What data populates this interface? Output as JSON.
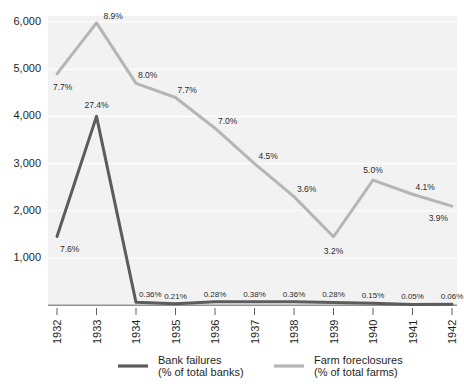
{
  "chart_data": {
    "type": "line",
    "title": "",
    "subtitle": "",
    "xlabel": "",
    "ylabel": "",
    "categories": [
      "1932",
      "1933",
      "1934",
      "1935",
      "1936",
      "1937",
      "1938",
      "1939",
      "1940",
      "1941",
      "1942"
    ],
    "ylim": [
      0,
      6300
    ],
    "yticks": [
      1000,
      2000,
      3000,
      4000,
      5000,
      6000
    ],
    "ytick_labels": [
      "1,000",
      "2,000",
      "3,000",
      "4,000",
      "5,000",
      "6,000"
    ],
    "grid": true,
    "legend_position": "bottom",
    "series": [
      {
        "name": "Bank failures",
        "unit_label": "(% of total banks)",
        "color": "#5c5c5c",
        "values": [
          1456,
          4000,
          61,
          32,
          72,
          75,
          74,
          59,
          43,
          15,
          20
        ],
        "point_labels": [
          "7.6%",
          "27.4%",
          "0.36%",
          "0.21%",
          "0.28%",
          "0.38%",
          "0.36%",
          "0.28%",
          "0.15%",
          "0.05%",
          "0.06%"
        ]
      },
      {
        "name": "Farm foreclosures",
        "unit_label": "(% of total farms)",
        "color": "#b5b5b5",
        "values": [
          4900,
          5980,
          4700,
          4400,
          3750,
          3000,
          2300,
          1450,
          2650,
          2350,
          2100
        ],
        "point_labels": [
          "7.7%",
          "8.9%",
          "8.0%",
          "7.7%",
          "7.0%",
          "4.5%",
          "3.6%",
          "3.2%",
          "5.0%",
          "4.1%",
          "3.9%"
        ]
      }
    ]
  },
  "legend": {
    "items": [
      {
        "name": "Bank failures",
        "unit": "(% of total banks)",
        "swatch_color": "#5c5c5c"
      },
      {
        "name": "Farm foreclosures",
        "unit": "(% of total farms)",
        "swatch_color": "#b5b5b5"
      }
    ]
  }
}
